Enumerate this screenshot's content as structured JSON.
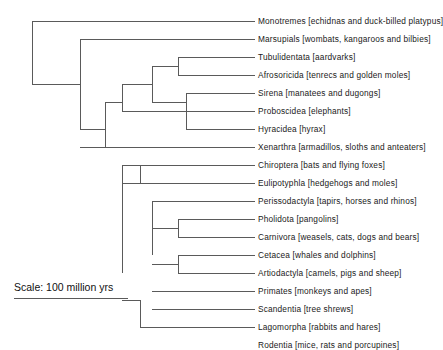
{
  "figure": {
    "type": "phylogenetic-tree",
    "line_color": "#5a5a5a",
    "text_color": "#1a1a1a",
    "background": "#ffffff"
  },
  "scale": {
    "label": "Scale: 100 million yrs",
    "bar_length_px": 114
  },
  "taxa": [
    {
      "name": "Monotremes",
      "common": "[echidnas and duck-billed platypus]",
      "label": "Monotremes [echidnas and duck-billed platypus]",
      "row": 0,
      "y": 21
    },
    {
      "name": "Marsupials",
      "common": "[wombats, kangaroos and bilbies]",
      "label": "Marsupials [wombats, kangaroos and bilbies]",
      "row": 1,
      "y": 39
    },
    {
      "name": "Tubulidentata",
      "common": "[aardvarks]",
      "label": "Tubulidentata [aardvarks]",
      "row": 2,
      "y": 57
    },
    {
      "name": "Afrosoricida",
      "common": "[tenrecs and golden moles]",
      "label": "Afrosoricida [tenrecs and golden moles]",
      "row": 3,
      "y": 75
    },
    {
      "name": "Sirena",
      "common": "[manatees and dugongs]",
      "label": "Sirena [manatees and dugongs]",
      "row": 4,
      "y": 93
    },
    {
      "name": "Proboscidea",
      "common": "[elephants]",
      "label": "Proboscidea [elephants]",
      "row": 5,
      "y": 111
    },
    {
      "name": "Hyracidea",
      "common": "[hyrax]",
      "label": "Hyracidea [hyrax]",
      "row": 6,
      "y": 129
    },
    {
      "name": "Xenarthra",
      "common": "[armadillos, sloths and anteaters]",
      "label": "Xenarthra [armadillos, sloths and anteaters]",
      "row": 7,
      "y": 147
    },
    {
      "name": "Chiroptera",
      "common": "[bats and flying foxes]",
      "label": "Chiroptera [bats and flying foxes]",
      "row": 8,
      "y": 165
    },
    {
      "name": "Eulipotyphla",
      "common": "[hedgehogs and moles]",
      "label": "Eulipotyphla [hedgehogs and moles]",
      "row": 9,
      "y": 183
    },
    {
      "name": "Perissodactyla",
      "common": "[tapirs, horses and rhinos]",
      "label": "Perissodactyla [tapirs, horses and rhinos]",
      "row": 10,
      "y": 201
    },
    {
      "name": "Pholidota",
      "common": "[pangolins]",
      "label": "Pholidota [pangolins]",
      "row": 11,
      "y": 219
    },
    {
      "name": "Carnivora",
      "common": "[weasels, cats, dogs and bears]",
      "label": "Carnivora [weasels, cats, dogs and bears]",
      "row": 12,
      "y": 237
    },
    {
      "name": "Cetacea",
      "common": "[whales and dolphins]",
      "label": "Cetacea [whales and dolphins]",
      "row": 13,
      "y": 255
    },
    {
      "name": "Artiodactyla",
      "common": "[camels, pigs and sheep]",
      "label": "Artiodactyla [camels, pigs and sheep]",
      "row": 14,
      "y": 273
    },
    {
      "name": "Primates",
      "common": "[monkeys and apes]",
      "label": "Primates [monkeys and apes]",
      "row": 15,
      "y": 291
    },
    {
      "name": "Scandentia",
      "common": "[tree shrews]",
      "label": "Scandentia [tree shrews]",
      "row": 16,
      "y": 309
    },
    {
      "name": "Lagomorpha",
      "common": "[rabbits and hares]",
      "label": "Lagomorpha [rabbits and hares]",
      "row": 17,
      "y": 327
    },
    {
      "name": "Rodentia",
      "common": "[mice, rats and porcupines]",
      "label": "Rodentia [mice, rats and porcupines]",
      "row": 18,
      "y": 345
    }
  ],
  "geometry": {
    "label_x": 258,
    "tip_x": 255,
    "row_step": 18,
    "first_row_y": 21,
    "y_offset": -16,
    "node_x": {
      "root": 32,
      "theria": 80,
      "placentalia": 105,
      "clade_122": 122,
      "clade_152": 152,
      "clade_172": 172,
      "clade_178": 178,
      "clade_205": 205
    }
  },
  "branches": [
    {
      "name": "root-vertical",
      "x1": 32,
      "y1": 5,
      "x2": 32,
      "y2": 68
    },
    {
      "name": "monotremes-tip",
      "x1": 32,
      "y1": 5,
      "x2": 255,
      "y2": 5
    },
    {
      "name": "theria-stem",
      "x1": 32,
      "y1": 68,
      "x2": 80,
      "y2": 68
    },
    {
      "name": "theria-vertical",
      "x1": 80,
      "y1": 23,
      "x2": 80,
      "y2": 113
    },
    {
      "name": "marsupials-tip",
      "x1": 80,
      "y1": 23,
      "x2": 255,
      "y2": 23
    },
    {
      "name": "placentalia-stem",
      "x1": 80,
      "y1": 113,
      "x2": 105,
      "y2": 113
    },
    {
      "name": "placentalia-vertical",
      "x1": 105,
      "y1": 86,
      "x2": 105,
      "y2": 131
    },
    {
      "name": "afrotheria-stem",
      "x1": 105,
      "y1": 86,
      "x2": 122,
      "y2": 86
    },
    {
      "name": "afrotheria-vertical",
      "x1": 122,
      "y1": 68,
      "x2": 122,
      "y2": 95
    },
    {
      "name": "afro-upper-stem",
      "x1": 122,
      "y1": 68,
      "x2": 152,
      "y2": 68
    },
    {
      "name": "afro-upper-vertical",
      "x1": 152,
      "y1": 50,
      "x2": 152,
      "y2": 86
    },
    {
      "name": "afroinsect-stem",
      "x1": 152,
      "y1": 50,
      "x2": 178,
      "y2": 50
    },
    {
      "name": "afroinsect-vertical",
      "x1": 178,
      "y1": 41,
      "x2": 178,
      "y2": 59
    },
    {
      "name": "tubulidentata-tip",
      "x1": 178,
      "y1": 41,
      "x2": 255,
      "y2": 41
    },
    {
      "name": "afrosoricida-tip",
      "x1": 178,
      "y1": 59,
      "x2": 255,
      "y2": 59
    },
    {
      "name": "paenungulata-stem",
      "x1": 152,
      "y1": 86,
      "x2": 186,
      "y2": 86
    },
    {
      "name": "paenungulata-vertical",
      "x1": 186,
      "y1": 77,
      "x2": 186,
      "y2": 113
    },
    {
      "name": "sirena-tip",
      "x1": 186,
      "y1": 77,
      "x2": 255,
      "y2": 77
    },
    {
      "name": "hyracidea-tip",
      "x1": 186,
      "y1": 113,
      "x2": 255,
      "y2": 113
    },
    {
      "name": "proboscidea-tip",
      "x1": 122,
      "y1": 95,
      "x2": 255,
      "y2": 95
    },
    {
      "name": "boreoeutheria-stem",
      "x1": 105,
      "y1": 131,
      "x2": 122,
      "y2": 131
    },
    {
      "name": "xenarthra-tip",
      "x1": 80,
      "y1": 131,
      "x2": 255,
      "y2": 131
    },
    {
      "name": "boreo-vertical",
      "x1": 122,
      "y1": 149,
      "x2": 122,
      "y2": 257
    },
    {
      "name": "laurasia-stem",
      "x1": 122,
      "y1": 149,
      "x2": 140,
      "y2": 149
    },
    {
      "name": "laurasia-vertical",
      "x1": 140,
      "y1": 149,
      "x2": 140,
      "y2": 167
    },
    {
      "name": "chiroptera-tip",
      "x1": 122,
      "y1": 149,
      "x2": 255,
      "y2": 149
    },
    {
      "name": "eulipotyphla-tip",
      "x1": 122,
      "y1": 167,
      "x2": 255,
      "y2": 167
    },
    {
      "name": "laurasia-core-vertical",
      "x1": 152,
      "y1": 185,
      "x2": 152,
      "y2": 239
    },
    {
      "name": "perissodactyla-tip",
      "x1": 152,
      "y1": 185,
      "x2": 255,
      "y2": 185
    },
    {
      "name": "ferae-stem",
      "x1": 152,
      "y1": 212,
      "x2": 178,
      "y2": 212
    },
    {
      "name": "ferae-vertical",
      "x1": 178,
      "y1": 203,
      "x2": 178,
      "y2": 221
    },
    {
      "name": "pholidota-tip",
      "x1": 178,
      "y1": 203,
      "x2": 255,
      "y2": 203
    },
    {
      "name": "carnivora-tip",
      "x1": 178,
      "y1": 221,
      "x2": 255,
      "y2": 221
    },
    {
      "name": "cetartio-stem",
      "x1": 152,
      "y1": 248,
      "x2": 178,
      "y2": 248
    },
    {
      "name": "cetartio-vertical",
      "x1": 178,
      "y1": 239,
      "x2": 178,
      "y2": 257
    },
    {
      "name": "cetacea-tip",
      "x1": 178,
      "y1": 239,
      "x2": 255,
      "y2": 239
    },
    {
      "name": "artiodactyla-tip",
      "x1": 178,
      "y1": 257,
      "x2": 255,
      "y2": 257
    },
    {
      "name": "euarchonto-stem",
      "x1": 122,
      "y1": 284,
      "x2": 140,
      "y2": 284
    },
    {
      "name": "euarchonto-vertical",
      "x1": 140,
      "y1": 284,
      "x2": 140,
      "y2": 311
    },
    {
      "name": "primates-tip",
      "x1": 152,
      "y1": 275,
      "x2": 255,
      "y2": 275
    },
    {
      "name": "scandentia-tip",
      "x1": 152,
      "y1": 293,
      "x2": 255,
      "y2": 293
    },
    {
      "name": "glires-stem",
      "x1": 140,
      "y1": 311,
      "x2": 178,
      "y2": 311
    },
    {
      "name": "lagomorpha-tip",
      "x1": 178,
      "y1": 311,
      "x2": 255,
      "y2": 311
    },
    {
      "name": "rodentia-tip",
      "x1": 178,
      "y1": 329,
      "x2": 255,
      "y2": 329
    }
  ]
}
